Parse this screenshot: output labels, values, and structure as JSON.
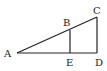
{
  "diagram": {
    "type": "geometry",
    "points": {
      "A": {
        "label": "A",
        "x": 17,
        "y": 53,
        "label_x": 4,
        "label_y": 57
      },
      "B": {
        "label": "B",
        "x": 70,
        "y": 30,
        "label_x": 63,
        "label_y": 26
      },
      "C": {
        "label": "C",
        "x": 97,
        "y": 17,
        "label_x": 93,
        "label_y": 14
      },
      "D": {
        "label": "D",
        "x": 97,
        "y": 53,
        "label_x": 95,
        "label_y": 66
      },
      "E": {
        "label": "E",
        "x": 70,
        "y": 53,
        "label_x": 66,
        "label_y": 66
      }
    },
    "segments": [
      {
        "from": "A",
        "to": "C"
      },
      {
        "from": "A",
        "to": "D"
      },
      {
        "from": "C",
        "to": "D"
      },
      {
        "from": "B",
        "to": "E"
      }
    ],
    "line_color": "#222222"
  }
}
